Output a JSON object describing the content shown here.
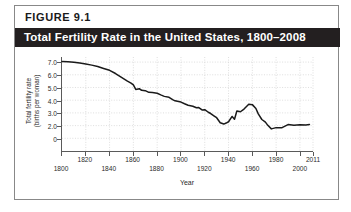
{
  "figure": {
    "number_label": "FIGURE  9.1",
    "title": "Total Fertility Rate in the United States, 1800–2008",
    "title_bar_color": "#231f20",
    "border_color": "#888888"
  },
  "chart_data": {
    "type": "line",
    "title": "Total Fertility Rate in the United States, 1800–2008",
    "xlabel": "Year",
    "ylabel": "Total fertility rate (births per woman)",
    "ylabel_lines": [
      "Total fertility rate",
      "(births per woman)"
    ],
    "xlim": [
      1800,
      2011
    ],
    "ylim": [
      0,
      7.4
    ],
    "grid": true,
    "grid_style": "dotted",
    "grid_color": "#cfcfcf",
    "line_color": "#1a1a1a",
    "legend": null,
    "legend_position": "none",
    "ytick_labels": [
      "7.0",
      "6.0",
      "5.0",
      "4.0",
      "3.0",
      "2.0",
      "0"
    ],
    "ytick_values": [
      7.0,
      6.0,
      5.0,
      4.0,
      3.0,
      2.0,
      1.0
    ],
    "xtick_labels": [
      "1800",
      "1820",
      "1840",
      "1860",
      "1880",
      "1900",
      "1920",
      "1940",
      "1960",
      "1980",
      "2000",
      "2011"
    ],
    "xtick_values": [
      1800,
      1820,
      1840,
      1860,
      1880,
      1900,
      1920,
      1940,
      1960,
      1980,
      2000,
      2011
    ],
    "xtick_label_rows": [
      "lower",
      "upper",
      "lower",
      "upper",
      "lower",
      "upper",
      "lower",
      "upper",
      "lower",
      "upper",
      "lower",
      "upper"
    ],
    "series": [
      {
        "name": "Total fertility rate",
        "x": [
          1800,
          1805,
          1810,
          1815,
          1820,
          1825,
          1830,
          1835,
          1840,
          1845,
          1850,
          1855,
          1858,
          1860,
          1862,
          1865,
          1867,
          1870,
          1873,
          1876,
          1880,
          1883,
          1886,
          1890,
          1893,
          1895,
          1900,
          1903,
          1906,
          1910,
          1913,
          1915,
          1918,
          1920,
          1923,
          1925,
          1928,
          1930,
          1933,
          1936,
          1938,
          1940,
          1943,
          1945,
          1947,
          1950,
          1953,
          1957,
          1960,
          1963,
          1965,
          1968,
          1971,
          1973,
          1976,
          1980,
          1985,
          1990,
          1995,
          2000,
          2005,
          2008
        ],
        "y": [
          7.04,
          7.02,
          6.98,
          6.92,
          6.85,
          6.76,
          6.65,
          6.5,
          6.35,
          6.1,
          5.8,
          5.5,
          5.35,
          5.21,
          4.85,
          4.9,
          4.78,
          4.75,
          4.62,
          4.6,
          4.55,
          4.42,
          4.3,
          4.23,
          4.05,
          3.95,
          3.85,
          3.72,
          3.6,
          3.52,
          3.4,
          3.42,
          3.22,
          3.25,
          3.05,
          2.95,
          2.75,
          2.62,
          2.22,
          2.12,
          2.2,
          2.3,
          2.72,
          2.5,
          3.15,
          3.09,
          3.3,
          3.68,
          3.65,
          3.35,
          2.92,
          2.48,
          2.27,
          2.02,
          1.74,
          1.84,
          1.84,
          2.08,
          2.02,
          2.06,
          2.05,
          2.08
        ]
      }
    ]
  }
}
